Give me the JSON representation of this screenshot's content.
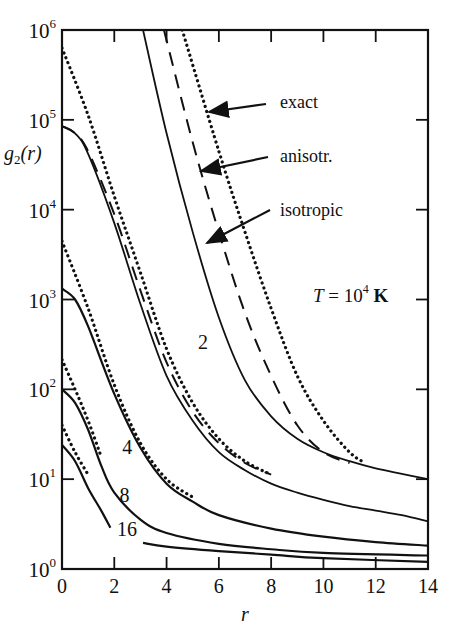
{
  "chart_data": {
    "type": "line",
    "title": "",
    "xlabel": "r",
    "ylabel": "g2(r)",
    "xlim": [
      0,
      14
    ],
    "ylim_log10": [
      0,
      6
    ],
    "yscale": "log",
    "x_ticks": [
      "0",
      "2",
      "4",
      "6",
      "8",
      "10",
      "12",
      "14"
    ],
    "y_ticks": [
      "10^0",
      "10^1",
      "10^2",
      "10^3",
      "10^4",
      "10^5",
      "10^6"
    ],
    "annotation": "T = 10^4 K",
    "legend_labels": [
      "exact",
      "anisotr.",
      "isotropic"
    ],
    "legend_styles": {
      "exact": "dotted",
      "anisotr.": "dashed",
      "isotropic": "solid"
    },
    "grid": false,
    "families": [
      {
        "label": "",
        "label_pos": null,
        "series": [
          {
            "name": "exact",
            "style": "dotted",
            "points": [
              [
                4.6,
                6
              ],
              [
                6,
                4.65
              ],
              [
                7,
                3.75
              ],
              [
                8,
                2.9
              ],
              [
                9,
                2.15
              ],
              [
                10,
                1.65
              ],
              [
                11,
                1.3
              ],
              [
                11.6,
                1.18
              ]
            ]
          },
          {
            "name": "anisotr.",
            "style": "dashed",
            "points": [
              [
                3.9,
                6
              ],
              [
                5,
                4.75
              ],
              [
                6,
                3.75
              ],
              [
                7,
                2.85
              ],
              [
                8,
                2.15
              ],
              [
                9,
                1.6
              ],
              [
                10,
                1.3
              ],
              [
                11,
                1.18
              ]
            ]
          },
          {
            "name": "isotropic",
            "style": "solid",
            "points": [
              [
                3.1,
                6
              ],
              [
                4,
                4.85
              ],
              [
                5,
                3.75
              ],
              [
                6,
                2.8
              ],
              [
                7,
                2.1
              ],
              [
                8,
                1.7
              ],
              [
                9,
                1.45
              ],
              [
                10,
                1.3
              ],
              [
                11,
                1.2
              ],
              [
                12,
                1.12
              ],
              [
                13,
                1.06
              ],
              [
                14,
                1.0
              ]
            ]
          }
        ]
      },
      {
        "label": "2",
        "label_pos": [
          5.2,
          2.45
        ],
        "series": [
          {
            "name": "exact",
            "style": "dotted",
            "points": [
              [
                0,
                5.8
              ],
              [
                1,
                5.05
              ],
              [
                2,
                4.15
              ],
              [
                3,
                3.3
              ],
              [
                4,
                2.45
              ],
              [
                5,
                1.85
              ],
              [
                6,
                1.45
              ],
              [
                7,
                1.2
              ],
              [
                8,
                1.05
              ]
            ]
          },
          {
            "name": "anisotr.",
            "style": "dashed",
            "points": [
              [
                0,
                4.93
              ],
              [
                0.5,
                4.85
              ],
              [
                1,
                4.65
              ],
              [
                2,
                3.95
              ],
              [
                3,
                3.1
              ],
              [
                4,
                2.3
              ],
              [
                5,
                1.75
              ],
              [
                6,
                1.4
              ],
              [
                7,
                1.18
              ],
              [
                8,
                1.05
              ]
            ]
          },
          {
            "name": "isotropic",
            "style": "solid",
            "points": [
              [
                0,
                4.93
              ],
              [
                0.5,
                4.85
              ],
              [
                1,
                4.62
              ],
              [
                2,
                3.85
              ],
              [
                3,
                2.95
              ],
              [
                4,
                2.15
              ],
              [
                5,
                1.65
              ],
              [
                6,
                1.3
              ],
              [
                7,
                1.1
              ],
              [
                8,
                0.95
              ],
              [
                9,
                0.85
              ],
              [
                10,
                0.77
              ],
              [
                11,
                0.7
              ],
              [
                12,
                0.65
              ],
              [
                13,
                0.6
              ],
              [
                14,
                0.53
              ]
            ]
          }
        ]
      },
      {
        "label": "4",
        "label_pos": [
          2.3,
          1.28
        ],
        "series": [
          {
            "name": "exact",
            "style": "dotted",
            "points": [
              [
                0,
                3.65
              ],
              [
                1,
                2.9
              ],
              [
                2,
                2.05
              ],
              [
                3,
                1.4
              ],
              [
                4,
                1.0
              ],
              [
                5,
                0.8
              ]
            ]
          },
          {
            "name": "isotropic",
            "style": "solid",
            "points": [
              [
                0,
                3.12
              ],
              [
                0.5,
                3.0
              ],
              [
                1,
                2.7
              ],
              [
                2,
                1.95
              ],
              [
                3,
                1.35
              ],
              [
                4,
                0.95
              ],
              [
                5,
                0.75
              ],
              [
                6,
                0.6
              ],
              [
                8,
                0.45
              ],
              [
                10,
                0.36
              ],
              [
                12,
                0.3
              ],
              [
                14,
                0.26
              ]
            ]
          }
        ]
      },
      {
        "label": "8",
        "label_pos": [
          2.2,
          0.75
        ],
        "series": [
          {
            "name": "exact",
            "style": "dotted",
            "points": [
              [
                0,
                2.33
              ],
              [
                0.5,
                2.0
              ],
              [
                1,
                1.65
              ],
              [
                1.5,
                1.25
              ]
            ]
          },
          {
            "name": "isotropic",
            "style": "solid",
            "points": [
              [
                0,
                2.0
              ],
              [
                0.5,
                1.85
              ],
              [
                1,
                1.55
              ],
              [
                1.5,
                1.15
              ],
              [
                2,
                0.85
              ],
              [
                3,
                0.55
              ],
              [
                4,
                0.4
              ],
              [
                6,
                0.28
              ],
              [
                8,
                0.22
              ],
              [
                10,
                0.18
              ],
              [
                14,
                0.15
              ]
            ]
          }
        ]
      },
      {
        "label": "16",
        "label_pos": [
          2.1,
          0.37
        ],
        "series": [
          {
            "name": "exact",
            "style": "dotted",
            "points": [
              [
                0,
                1.6
              ],
              [
                0.5,
                1.3
              ],
              [
                1,
                1.05
              ]
            ]
          },
          {
            "name": "isotropic",
            "style": "solid",
            "points": [
              [
                0,
                1.38
              ],
              [
                0.5,
                1.2
              ],
              [
                1,
                0.9
              ],
              [
                1.5,
                0.65
              ],
              [
                1.85,
                0.46
              ]
            ]
          },
          {
            "name": "isotropic-tail",
            "style": "solid",
            "points": [
              [
                3.1,
                0.29
              ],
              [
                4,
                0.25
              ],
              [
                6,
                0.2
              ],
              [
                8,
                0.16
              ],
              [
                10,
                0.12
              ],
              [
                14,
                0.08
              ]
            ]
          }
        ]
      }
    ]
  }
}
